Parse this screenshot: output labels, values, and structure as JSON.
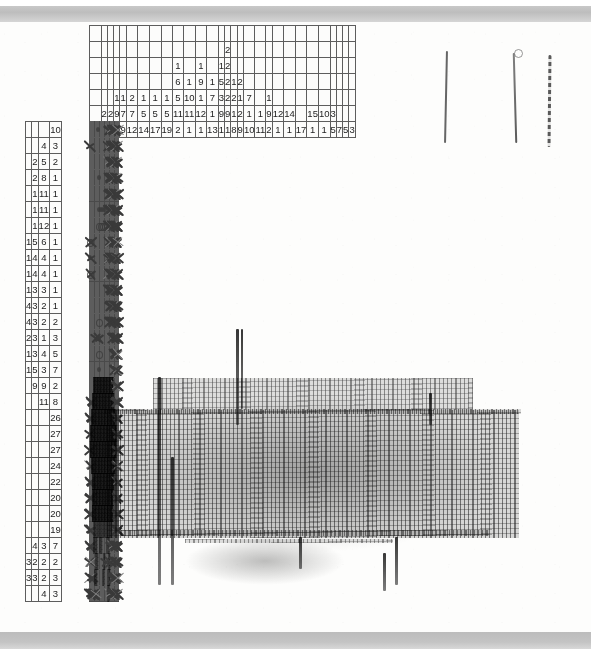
{
  "document": {
    "type": "nonogram-puzzle-worksheet",
    "medium": "scanned hand-drawn grid paper",
    "grid": {
      "columns": 29,
      "rows": 30,
      "cell_size_px": 16
    },
    "column_clue_depth": 6,
    "row_clue_width": 4
  },
  "colors": {
    "paper": "#fdfdfc",
    "grid_line": "#5d5d5d",
    "grid_line_major": "#4a4a4a",
    "pencil": "#3a3a3a",
    "scanner_band": "#c4c4c4",
    "clue_text": "#1d1d1d"
  },
  "column_clues": [
    [
      "10"
    ],
    [
      "2",
      "5"
    ],
    [
      "2",
      "7"
    ],
    [
      "1",
      "9",
      "5"
    ],
    [
      "1",
      "7",
      "9"
    ],
    [
      "2",
      "7",
      "12"
    ],
    [
      "1",
      "5",
      "14"
    ],
    [
      "1",
      "5",
      "17"
    ],
    [
      "1",
      "5",
      "19"
    ],
    [
      "6",
      "5",
      "11",
      "2"
    ],
    [
      "1",
      "1",
      "10",
      "11",
      "1"
    ],
    [
      "1",
      "9",
      "1",
      "12",
      "1"
    ],
    [
      "1",
      "1",
      "7",
      "1",
      "13"
    ],
    [
      "2",
      "2",
      "3",
      "9",
      "1"
    ],
    [
      "2",
      "1",
      "2",
      "2",
      "9",
      "1"
    ],
    [
      "1",
      "1",
      "1",
      "8"
    ],
    [
      "2",
      "7",
      "2",
      "9"
    ],
    [
      "1",
      "10"
    ],
    [
      "1",
      "1",
      "11"
    ],
    [
      "9",
      "2"
    ],
    [
      "12",
      "1"
    ],
    [
      "14",
      "1"
    ],
    [
      "17"
    ],
    [
      "15",
      "1"
    ],
    [
      "10",
      "1"
    ],
    [
      "3",
      "3"
    ],
    [
      "7"
    ],
    [
      "5"
    ],
    [
      "3"
    ],
    [
      "2"
    ]
  ],
  "column_clue_matrix": [
    [
      "",
      "",
      "",
      "",
      "",
      "",
      "",
      "",
      "",
      "",
      "",
      "",
      "",
      "",
      "",
      "",
      "",
      "",
      "",
      "",
      "",
      "",
      "",
      "",
      "",
      "",
      "",
      "",
      ""
    ],
    [
      "",
      "",
      "",
      "",
      "",
      "",
      "",
      "",
      "",
      "",
      "",
      "",
      "",
      "",
      "2",
      "",
      "",
      "",
      "",
      "",
      "",
      "",
      "",
      "",
      "",
      "",
      "",
      "",
      ""
    ],
    [
      "",
      "",
      "",
      "",
      "",
      "",
      "",
      "",
      "",
      "1",
      "",
      "1",
      "",
      "1",
      "2",
      "",
      "",
      "",
      "",
      "",
      "",
      "",
      "",
      "",
      "",
      "",
      "",
      "",
      ""
    ],
    [
      "",
      "",
      "",
      "",
      "",
      "",
      "",
      "",
      "",
      "6",
      "1",
      "9",
      "1",
      "5",
      "2",
      "1",
      "2",
      "",
      "",
      "",
      "",
      "",
      "",
      "",
      "",
      "",
      "",
      "",
      ""
    ],
    [
      "",
      "",
      "",
      "1",
      "1",
      "2",
      "1",
      "1",
      "1",
      "5",
      "10",
      "1",
      "7",
      "3",
      "2",
      "2",
      "1",
      "7",
      "",
      "1",
      "",
      "",
      "",
      "",
      "",
      "",
      "",
      "",
      ""
    ],
    [
      "",
      "2",
      "2",
      "9",
      "7",
      "7",
      "5",
      "5",
      "5",
      "11",
      "11",
      "12",
      "1",
      "9",
      "9",
      "1",
      "2",
      "1",
      "1",
      "9",
      "12",
      "14",
      "",
      "15",
      "10",
      "3",
      "",
      "",
      ""
    ],
    [
      "10",
      "5",
      "7",
      "5",
      "9",
      "12",
      "14",
      "17",
      "19",
      "2",
      "1",
      "1",
      "13",
      "1",
      "1",
      "8",
      "9",
      "10",
      "11",
      "2",
      "1",
      "1",
      "17",
      "1",
      "1",
      "5",
      "7",
      "5",
      "3"
    ]
  ],
  "column_clue_matrix_last_row_extra": [
    "2"
  ],
  "row_clues": [
    [
      "10"
    ],
    [
      "4",
      "3"
    ],
    [
      "2",
      "5",
      "2"
    ],
    [
      "2",
      "8",
      "1"
    ],
    [
      "1",
      "11",
      "1"
    ],
    [
      "1",
      "11",
      "1"
    ],
    [
      "1",
      "12",
      "1"
    ],
    [
      "1",
      "5",
      "6",
      "1"
    ],
    [
      "1",
      "4",
      "4",
      "1"
    ],
    [
      "1",
      "4",
      "4",
      "1"
    ],
    [
      "1",
      "3",
      "3",
      "1"
    ],
    [
      "4",
      "3",
      "2",
      "1"
    ],
    [
      "4",
      "3",
      "2",
      "2"
    ],
    [
      "2",
      "3",
      "1",
      "3"
    ],
    [
      "1",
      "3",
      "4",
      "5"
    ],
    [
      "1",
      "5",
      "3",
      "7"
    ],
    [
      "9",
      "9",
      "2"
    ],
    [
      "11",
      "8"
    ],
    [
      "26"
    ],
    [
      "27"
    ],
    [
      "27"
    ],
    [
      "24"
    ],
    [
      "22"
    ],
    [
      "20"
    ],
    [
      "20"
    ],
    [
      "19"
    ],
    [
      "4",
      "3",
      "7"
    ],
    [
      "3",
      "2",
      "2",
      "2"
    ],
    [
      "3",
      "3",
      "2",
      "3"
    ],
    [
      "4",
      "3"
    ]
  ],
  "marks": {
    "filled_legend": "heavy graphite scribble",
    "cross_legend": "X pencil cross = known empty",
    "dot_legend": "small dot / circle = tentative mark"
  },
  "annotations": {
    "vertical_ink_strokes": 3,
    "description_of_filled_shape": "large dark scribbled mass occupying the lower-middle of the grid"
  }
}
